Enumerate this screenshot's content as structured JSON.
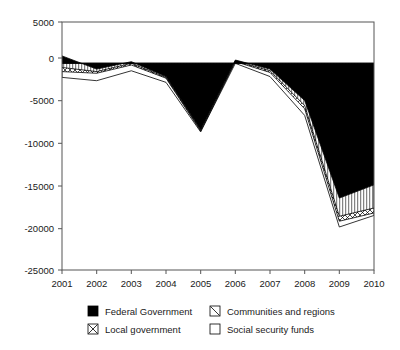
{
  "chart_data": {
    "type": "area",
    "stacked": true,
    "title": "",
    "subtitle": "",
    "xlabel": "",
    "ylabel": "",
    "categories": [
      "2001",
      "2002",
      "2003",
      "2004",
      "2005",
      "2006",
      "2007",
      "2008",
      "2009",
      "2010"
    ],
    "x": [
      2001,
      2002,
      2003,
      2004,
      2005,
      2006,
      2007,
      2008,
      2009,
      2010
    ],
    "ylim": [
      -25000,
      5000
    ],
    "yticks": [
      5000,
      0,
      -5000,
      -10000,
      -15000,
      -20000,
      -25000
    ],
    "ytick_labels": [
      "5000",
      "0",
      "-5000",
      "-10000",
      "-15000",
      "-20000",
      "-25000"
    ],
    "grid": false,
    "legend_position": "bottom",
    "series": [
      {
        "name": "Federal Government",
        "pattern": "solid-black",
        "color": "#000000",
        "values": [
          900,
          -700,
          200,
          -1600,
          -8000,
          400,
          -700,
          -4500,
          -16300,
          -14700
        ]
      },
      {
        "name": "Communities and regions",
        "pattern": "diagonal-hatch",
        "color": "#ffffff",
        "values": [
          -1400,
          -300,
          -200,
          -100,
          -100,
          -100,
          -200,
          -600,
          -2200,
          -2800
        ]
      },
      {
        "name": "Local government",
        "pattern": "cross-hatch",
        "color": "#ffffff",
        "values": [
          -500,
          -200,
          -200,
          -100,
          -100,
          -100,
          -200,
          -400,
          -600,
          -600
        ]
      },
      {
        "name": "Social security funds",
        "pattern": "white",
        "color": "#ffffff",
        "values": [
          -700,
          -900,
          -700,
          -500,
          -100,
          -200,
          -500,
          -800,
          -700,
          -300
        ]
      }
    ],
    "cumulative_boundaries": [
      {
        "name": "Federal Government",
        "values": [
          900,
          -700,
          200,
          -1600,
          -8000,
          400,
          -700,
          -4500,
          -16300,
          -14700
        ]
      },
      {
        "name": "+ Communities and regions",
        "values": [
          -500,
          -1000,
          0,
          -1700,
          -8100,
          300,
          -900,
          -5100,
          -18500,
          -17500
        ]
      },
      {
        "name": "+ Local government",
        "values": [
          -1000,
          -1200,
          -200,
          -1800,
          -8200,
          200,
          -1100,
          -5500,
          -19100,
          -18100
        ]
      },
      {
        "name": "+ Social security funds",
        "values": [
          -1700,
          -2100,
          -900,
          -2300,
          -8300,
          0,
          -1600,
          -6300,
          -19800,
          -18400
        ]
      }
    ]
  },
  "axes": {
    "y_ticks": [
      "5000",
      "0",
      "-5000",
      "-10000",
      "-15000",
      "-20000",
      "-25000"
    ],
    "x_ticks": [
      "2001",
      "2002",
      "2003",
      "2004",
      "2005",
      "2006",
      "2007",
      "2008",
      "2009",
      "2010"
    ]
  },
  "legend": {
    "items": [
      {
        "label": "Federal Government",
        "swatch": "solid-black"
      },
      {
        "label": "Communities and regions",
        "swatch": "diagonal-hatch"
      },
      {
        "label": "Local government",
        "swatch": "cross-hatch"
      },
      {
        "label": "Social security funds",
        "swatch": "white"
      }
    ]
  }
}
